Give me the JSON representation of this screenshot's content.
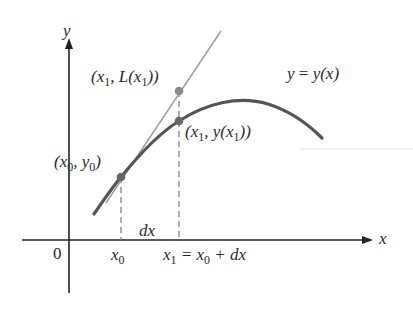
{
  "diagram": {
    "type": "linear-approximation-figure",
    "colors": {
      "axes": "#222222",
      "curve": "#555555",
      "tangent": "#999999",
      "points": "#666666",
      "dashed": "#777777",
      "text": "#2a2a2a"
    },
    "axes": {
      "x_label": "x",
      "y_label": "y",
      "origin_label": "0"
    },
    "curve_label": {
      "lhs": "y",
      "eq": " = ",
      "rhs_fn": "y",
      "rhs_arg": "(x)"
    },
    "points": [
      {
        "name": "x0-y0",
        "label_parts": [
          "(x",
          "0",
          ", y",
          "0",
          ")"
        ]
      },
      {
        "name": "x1-Lx1",
        "label_parts": [
          "(x",
          "1",
          ", L(x",
          "1",
          "))"
        ]
      },
      {
        "name": "x1-yx1",
        "label_parts": [
          "(x",
          "1",
          ", y(x",
          "1",
          "))"
        ]
      }
    ],
    "tick_labels": {
      "x0": {
        "var": "x",
        "sub": "0"
      },
      "dx": "dx",
      "x1_eq": {
        "var": "x",
        "sub": "1",
        "rest_a": " = x",
        "rest_sub": "0",
        "rest_b": " + dx"
      }
    }
  }
}
